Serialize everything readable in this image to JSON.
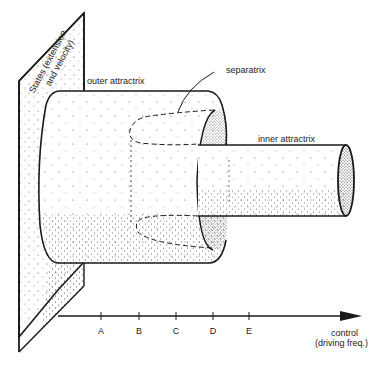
{
  "labels": {
    "states_line1": "States (extension",
    "states_line2": "and velocity)",
    "outer_attractrix": "outer attractrix",
    "separatrix": "separatrix",
    "inner_attractrix": "inner attractrix",
    "control_line1": "control",
    "control_line2": "(driving freq.)"
  },
  "axis": {
    "ticks": [
      "A",
      "B",
      "C",
      "D",
      "E"
    ]
  },
  "colors": {
    "ink": "#1a1a1a",
    "stipple": "#333333",
    "background": "#ffffff"
  }
}
